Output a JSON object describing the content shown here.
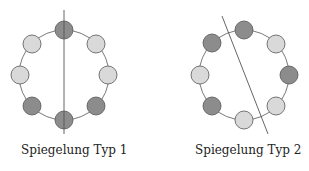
{
  "colors": {
    "dark": "#8c8c8c",
    "light": "#d9d9d9",
    "stroke": "#555555"
  },
  "diagrams": [
    {
      "caption": "Spiegelung Typ 1",
      "center": [
        64,
        75
      ],
      "radius": 45,
      "axis": {
        "x1": 64,
        "y1": 10,
        "x2": 64,
        "y2": 134
      },
      "beads": [
        {
          "cx": 64,
          "cy": 30,
          "shade": "dark"
        },
        {
          "cx": 96,
          "cy": 44,
          "shade": "light"
        },
        {
          "cx": 108,
          "cy": 75,
          "shade": "light"
        },
        {
          "cx": 96,
          "cy": 106,
          "shade": "dark"
        },
        {
          "cx": 64,
          "cy": 120,
          "shade": "dark"
        },
        {
          "cx": 32,
          "cy": 106,
          "shade": "dark"
        },
        {
          "cx": 20,
          "cy": 75,
          "shade": "light"
        },
        {
          "cx": 32,
          "cy": 44,
          "shade": "light"
        }
      ]
    },
    {
      "caption": "Spiegelung Typ 2",
      "center": [
        244,
        75
      ],
      "radius": 45,
      "axis": {
        "x1": 222,
        "y1": 16,
        "x2": 268,
        "y2": 134
      },
      "beads": [
        {
          "cx": 244,
          "cy": 30,
          "shade": "dark"
        },
        {
          "cx": 276,
          "cy": 44,
          "shade": "light"
        },
        {
          "cx": 289,
          "cy": 75,
          "shade": "dark"
        },
        {
          "cx": 276,
          "cy": 106,
          "shade": "light"
        },
        {
          "cx": 244,
          "cy": 120,
          "shade": "light"
        },
        {
          "cx": 212,
          "cy": 106,
          "shade": "dark"
        },
        {
          "cx": 200,
          "cy": 75,
          "shade": "light"
        },
        {
          "cx": 212,
          "cy": 43,
          "shade": "dark"
        }
      ]
    }
  ]
}
